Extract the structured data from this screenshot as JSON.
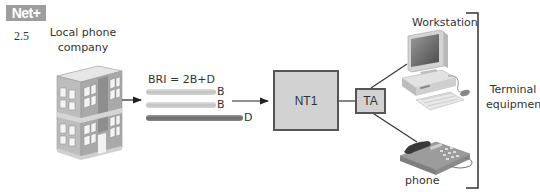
{
  "header": {
    "badge": "Net+",
    "section": "2.5"
  },
  "source": {
    "label_line1": "Local phone",
    "label_line2": "company",
    "icon": "office-building-icon"
  },
  "bri": {
    "title": "BRI = 2B+D",
    "channels": [
      {
        "label": "B",
        "color": "#c4c4c4"
      },
      {
        "label": "B",
        "color": "#c4c4c4"
      },
      {
        "label": "D",
        "color": "#7a7a7a"
      }
    ]
  },
  "devices": {
    "nt1": "NT1",
    "ta": "TA"
  },
  "terminals": {
    "workstation": {
      "label": "Workstation",
      "icon": "desktop-computer-icon"
    },
    "phone": {
      "label": "phone",
      "icon": "telephone-icon"
    },
    "group_label_line1": "Terminal",
    "group_label_line2": "equipment"
  },
  "colors": {
    "box_fill": "#d2d2d2",
    "box_border": "#555555",
    "badge_bg": "#9e9e9e",
    "line": "#333333"
  }
}
